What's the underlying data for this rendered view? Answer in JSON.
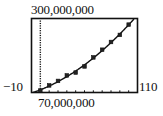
{
  "chart_data": {
    "type": "scatter",
    "title": "",
    "xlabel": "",
    "ylabel": "",
    "window": {
      "xmin": -10,
      "xmax": 110,
      "ymin": 70000000,
      "ymax": 300000000,
      "xscale": 10
    },
    "labels": {
      "xmin": "−10",
      "xmax": "110",
      "ymin": "70,000,000",
      "ymax": "300,000,000"
    },
    "grid": false,
    "legend": null,
    "series": [
      {
        "name": "data points",
        "style": "points",
        "x": [
          0,
          10,
          20,
          30,
          40,
          50,
          60,
          70,
          80,
          90,
          100
        ],
        "y": [
          76000000,
          92000000,
          106000000,
          123000000,
          132000000,
          151000000,
          179000000,
          203000000,
          227000000,
          249000000,
          281000000
        ]
      },
      {
        "name": "fitted curve",
        "style": "line",
        "model": "quadratic",
        "x_range": [
          -10,
          110
        ]
      }
    ],
    "annotations": [
      "y-axis drawn as dotted vertical line at x = 0",
      "tick marks every 10 units along bottom"
    ]
  }
}
